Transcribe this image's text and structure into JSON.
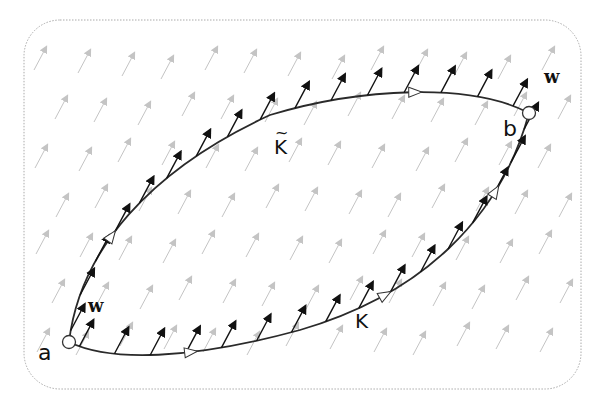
{
  "diagram": {
    "colors": {
      "field_arrow": "#c4c4c4",
      "curve": "#2a2a2a",
      "vector_arrow": "#111111",
      "border": "#aaaaaa",
      "background": "#ffffff"
    },
    "points": {
      "a": {
        "label": "a",
        "x": 69,
        "y": 342
      },
      "b": {
        "label": "b",
        "x": 529,
        "y": 113
      }
    },
    "curves": {
      "upper": {
        "label": "K",
        "tilde": "~",
        "name": "K-tilde"
      },
      "lower": {
        "label": "K",
        "name": "K"
      }
    },
    "vector_labels": {
      "w_at_a": "w",
      "w_at_b": "w"
    },
    "field": {
      "direction": "up-right",
      "angle_deg": -62,
      "arrow_length": 26
    }
  }
}
